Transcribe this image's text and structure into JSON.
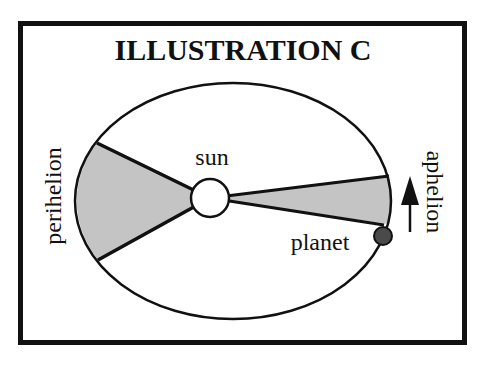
{
  "diagram": {
    "title": "ILLUSTRATION C",
    "labels": {
      "sun": "sun",
      "planet": "planet",
      "perihelion": "perihelion",
      "aphelion": "aphelion"
    },
    "elements": {
      "orbit": {
        "shape": "ellipse",
        "cx": 233,
        "cy": 201,
        "rx": 158,
        "ry": 118
      },
      "sun": {
        "shape": "circle",
        "cx": 210,
        "cy": 198,
        "r": 19,
        "fill": "#ffffff"
      },
      "planet": {
        "shape": "circle",
        "cx": 383,
        "cy": 236,
        "r": 9,
        "fill": "#4a4a4a"
      },
      "perihelion_sector": {
        "fill": "#c4c4c4",
        "description": "wide shaded area swept near perihelion"
      },
      "aphelion_sector": {
        "fill": "#c4c4c4",
        "description": "narrow shaded area swept near aphelion"
      },
      "direction_arrow": {
        "direction": "up",
        "meaning": "planet direction of motion"
      }
    },
    "colors": {
      "frame": "#111111",
      "shade": "#c4c4c4",
      "planet": "#4a4a4a",
      "background": "#ffffff"
    }
  }
}
